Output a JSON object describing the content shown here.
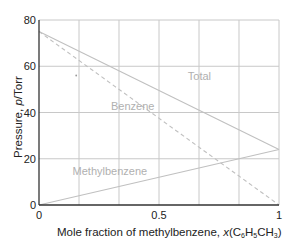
{
  "chart_data": {
    "type": "line",
    "title": "",
    "xlabel": "Mole fraction of methylbenzene, x(C6H5CH3)",
    "xlabel_parts": {
      "main": "Mole fraction of methylbenzene, ",
      "x": "x",
      "open": "(C",
      "s1": "6",
      "h": "H",
      "s2": "5",
      "ch": "CH",
      "s3": "3",
      "close": ")"
    },
    "ylabel": "Pressure, p/Torr",
    "ylabel_parts": {
      "main": "Pressure, ",
      "p": "p",
      "unit": "/Torr"
    },
    "xlim": [
      0,
      1
    ],
    "ylim": [
      0,
      80
    ],
    "xticks": [
      {
        "v": 0,
        "label": "0"
      },
      {
        "v": 0.5,
        "label": "0.5"
      },
      {
        "v": 1,
        "label": "1"
      }
    ],
    "yticks": [
      {
        "v": 0,
        "label": "0"
      },
      {
        "v": 20,
        "label": "20"
      },
      {
        "v": 40,
        "label": "40"
      },
      {
        "v": 60,
        "label": "60"
      },
      {
        "v": 80,
        "label": "80"
      }
    ],
    "x_gridlines": [
      0.1667,
      0.3333,
      0.5,
      0.6667,
      0.8333,
      1
    ],
    "y_gridlines": [
      20,
      40,
      60,
      80
    ],
    "grid": true,
    "series": [
      {
        "name": "Total",
        "style": "solid",
        "x": [
          0,
          1
        ],
        "y": [
          75,
          24
        ],
        "label_pos": [
          0.62,
          54
        ]
      },
      {
        "name": "Benzene",
        "style": "dashed",
        "x": [
          0,
          1
        ],
        "y": [
          75,
          0
        ],
        "label_pos": [
          0.3,
          41
        ]
      },
      {
        "name": "Methylbenzene",
        "style": "solid",
        "x": [
          0,
          1
        ],
        "y": [
          0,
          24
        ],
        "label_pos": [
          0.14,
          13
        ]
      }
    ],
    "annotations": [
      {
        "type": "dot",
        "x": 0.155,
        "y": 56
      }
    ],
    "colors": {
      "axis": "#333333",
      "grid": "#c8c8c8",
      "line": "#c0c0c0",
      "label": "#b0b0b0"
    }
  }
}
